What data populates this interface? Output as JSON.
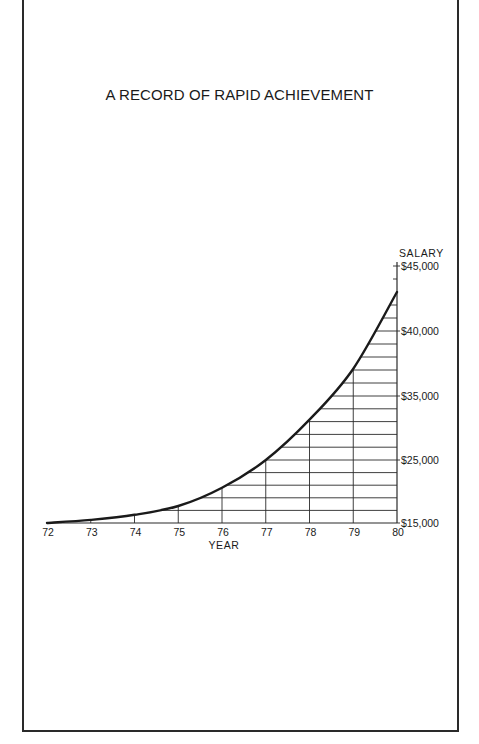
{
  "page": {
    "title": "A RECORD OF RAPID ACHIEVEMENT"
  },
  "colors": {
    "ink": "#1a1a1a",
    "grid": "#2a2a2a",
    "background": "#ffffff"
  },
  "chart_data": {
    "type": "area",
    "title": "A RECORD OF RAPID ACHIEVEMENT",
    "xlabel": "YEAR",
    "ylabel": "SALARY",
    "y_axis_position": "right",
    "categories": [
      "72",
      "73",
      "74",
      "75",
      "76",
      "77",
      "78",
      "79",
      "80"
    ],
    "series": [
      {
        "name": "Salary",
        "values": [
          15000,
          15500,
          16300,
          17700,
          20600,
          25000,
          31300,
          37100,
          43000
        ]
      }
    ],
    "y_tick_labels": [
      "$45,000",
      "$40,000",
      "$35,000",
      "$25,000",
      "$15,000"
    ],
    "y_tick_values": [
      45000,
      40000,
      35000,
      25000,
      15000
    ],
    "y_scale_note": "non-linear: $1,000 per gridline above $35,000, $2,000 per gridline below",
    "ylim": [
      15000,
      45000
    ],
    "grid": true,
    "fill_style": "hatched gridlines under curve",
    "legend": null
  },
  "axis": {
    "ylabel": "SALARY",
    "xlabel": "YEAR",
    "y_labels": [
      "$45,000",
      "$40,000",
      "$35,000",
      "$25,000",
      "$15,000"
    ],
    "x_labels": [
      "72",
      "73",
      "74",
      "75",
      "76",
      "77",
      "78",
      "79",
      "80"
    ]
  }
}
